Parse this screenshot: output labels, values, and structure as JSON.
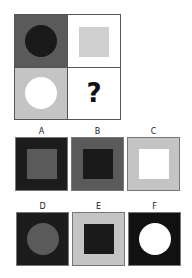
{
  "puzzle": {
    "question_mark": "?",
    "cells": [
      {
        "bg": "#5a5a5a",
        "shape": "circle",
        "fill": "#1a1a1a"
      },
      {
        "bg": "#ffffff",
        "shape": "square",
        "fill": "#cfcfcf"
      },
      {
        "bg": "#c4c4c4",
        "shape": "circle",
        "fill": "#ffffff"
      },
      {
        "bg": "#ffffff",
        "shape": "unknown",
        "fill": ""
      }
    ]
  },
  "options": [
    {
      "label": "A",
      "bg": "#1c1c1c",
      "shape": "square",
      "fill": "#5a5a5a"
    },
    {
      "label": "B",
      "bg": "#5a5a5a",
      "shape": "square",
      "fill": "#1a1a1a"
    },
    {
      "label": "C",
      "bg": "#c4c4c4",
      "shape": "square",
      "fill": "#ffffff"
    },
    {
      "label": "D",
      "bg": "#1c1c1c",
      "shape": "circle",
      "fill": "#5a5a5a"
    },
    {
      "label": "E",
      "bg": "#c4c4c4",
      "shape": "square",
      "fill": "#1a1a1a"
    },
    {
      "label": "F",
      "bg": "#111111",
      "shape": "circle",
      "fill": "#ffffff"
    }
  ]
}
